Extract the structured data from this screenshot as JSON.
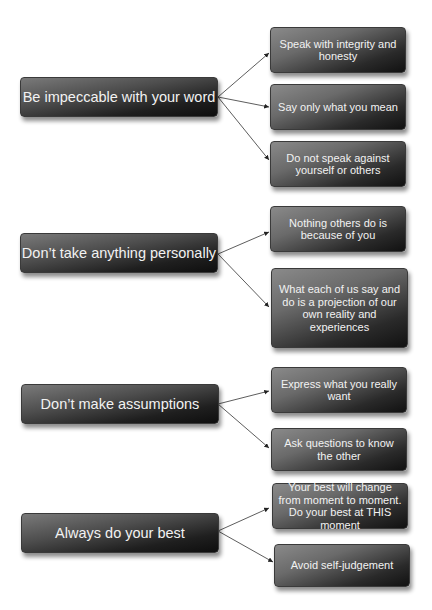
{
  "diagram": {
    "type": "mind-map",
    "colors": {
      "box_dark": "#111111",
      "box_light": "#8a8a8a",
      "text": "#f2f2f2",
      "arrow": "#333333",
      "background": "#ffffff"
    },
    "agreements": [
      {
        "label": "Be impeccable with your word",
        "children": [
          "Speak with integrity and honesty",
          "Say only what you mean",
          "Do not speak against yourself or others"
        ]
      },
      {
        "label": "Don’t take anything personally",
        "children": [
          "Nothing others do is because of you",
          "What each of us say and do is a projection of our own reality and experiences"
        ]
      },
      {
        "label": "Don’t make assumptions",
        "children": [
          "Express what you really want",
          "Ask questions to know the other"
        ]
      },
      {
        "label": "Always do your best",
        "children": [
          "Your best will change from moment to moment. Do your best at THIS moment",
          "Avoid self-judgement"
        ]
      }
    ]
  }
}
